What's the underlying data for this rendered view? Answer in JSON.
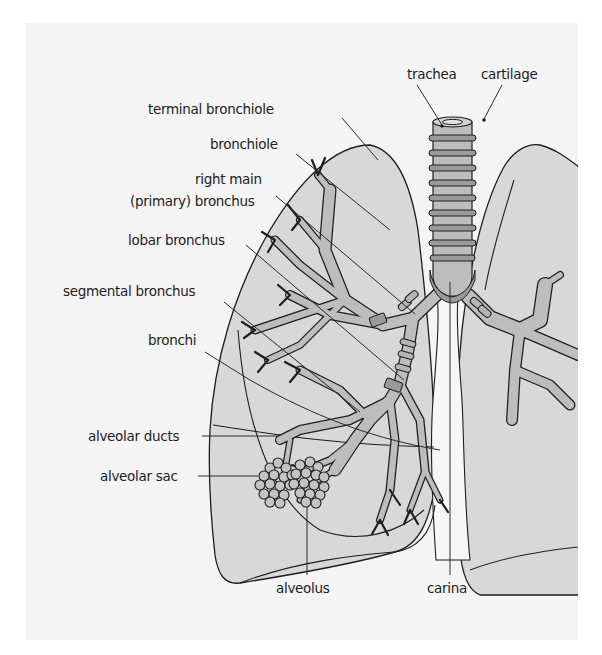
{
  "diagram": {
    "colors": {
      "panel_background": "#f4f4f4",
      "lung_fill": "#d8d8d8",
      "airway_fill": "#bdbdbd",
      "cartilage_ring": "#9a9a9a",
      "outline": "#1e1e1e",
      "label_text": "#1c1c1c"
    },
    "labels": {
      "trachea": "trachea",
      "cartilage": "cartilage",
      "terminal_bronchiole": "terminal bronchiole",
      "bronchiole": "bronchiole",
      "right_main_line1": "right main",
      "right_main_line2": "(primary) bronchus",
      "lobar_bronchus": "lobar bronchus",
      "segmental_bronchus": "segmental bronchus",
      "bronchi": "bronchi",
      "alveolar_ducts": "alveolar ducts",
      "alveolar_sac": "alveolar sac",
      "alveolus": "alveolus",
      "carina": "carina"
    }
  }
}
